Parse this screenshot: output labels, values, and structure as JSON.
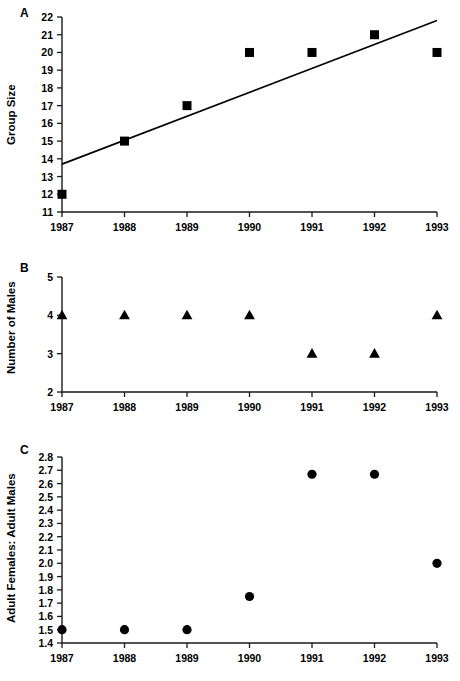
{
  "figure": {
    "panels": [
      {
        "letter": "A",
        "ylabel": "Group Size",
        "ytick_labels": [
          "22",
          "21",
          "20",
          "19",
          "18",
          "17",
          "16",
          "15",
          "14",
          "13",
          "12",
          "11"
        ],
        "xtick_labels": [
          "1987",
          "1988",
          "1989",
          "1990",
          "1991",
          "1992",
          "1993"
        ]
      },
      {
        "letter": "B",
        "ylabel": "Number of Males",
        "ytick_labels": [
          "5",
          "4",
          "3",
          "2"
        ],
        "xtick_labels": [
          "1987",
          "1988",
          "1989",
          "1990",
          "1991",
          "1992",
          "1993"
        ]
      },
      {
        "letter": "C",
        "ylabel": "Adult Females: Adult Males",
        "ytick_labels": [
          "2.8",
          "2.7",
          "2.6",
          "2.5",
          "2.4",
          "2.3",
          "2.2",
          "2.1",
          "2.0",
          "1.9",
          "1.8",
          "1.7",
          "1.6",
          "1.5",
          "1.4"
        ],
        "xtick_labels": [
          "1987",
          "1988",
          "1989",
          "1990",
          "1991",
          "1992",
          "1993"
        ]
      }
    ]
  },
  "chart_data": [
    {
      "type": "scatter",
      "panel": "A",
      "title": "",
      "xlabel": "",
      "ylabel": "Group Size",
      "categories": [
        "1987",
        "1988",
        "1989",
        "1990",
        "1991",
        "1992",
        "1993"
      ],
      "x": [
        1987,
        1988,
        1989,
        1990,
        1991,
        1992,
        1993
      ],
      "values": [
        12,
        15,
        17,
        20,
        20,
        21,
        20
      ],
      "ylim": [
        11,
        22
      ],
      "ytick_step": 1,
      "grid": false,
      "legend": "none",
      "marker": "filled-square",
      "marker_color": "#000000",
      "trendline": {
        "type": "line",
        "x": [
          1987.0,
          1993.0
        ],
        "y": [
          13.7,
          21.8
        ],
        "color": "#000000"
      }
    },
    {
      "type": "scatter",
      "panel": "B",
      "title": "",
      "xlabel": "",
      "ylabel": "Number of Males",
      "categories": [
        "1987",
        "1988",
        "1989",
        "1990",
        "1991",
        "1992",
        "1993"
      ],
      "x": [
        1987,
        1988,
        1989,
        1990,
        1991,
        1992,
        1993
      ],
      "values": [
        4,
        4,
        4,
        4,
        3,
        3,
        4
      ],
      "ylim": [
        2,
        5
      ],
      "ytick_step": 1,
      "grid": false,
      "legend": "none",
      "marker": "filled-triangle",
      "marker_color": "#000000"
    },
    {
      "type": "scatter",
      "panel": "C",
      "title": "",
      "xlabel": "",
      "ylabel": "Adult Females: Adult Males",
      "categories": [
        "1987",
        "1988",
        "1989",
        "1990",
        "1991",
        "1992",
        "1993"
      ],
      "x": [
        1987,
        1988,
        1989,
        1990,
        1991,
        1992,
        1993
      ],
      "values": [
        1.5,
        1.5,
        1.5,
        1.75,
        2.67,
        2.67,
        2.0
      ],
      "ylim": [
        1.4,
        2.8
      ],
      "ytick_step": 0.1,
      "grid": false,
      "legend": "none",
      "marker": "filled-circle",
      "marker_color": "#000000"
    }
  ]
}
